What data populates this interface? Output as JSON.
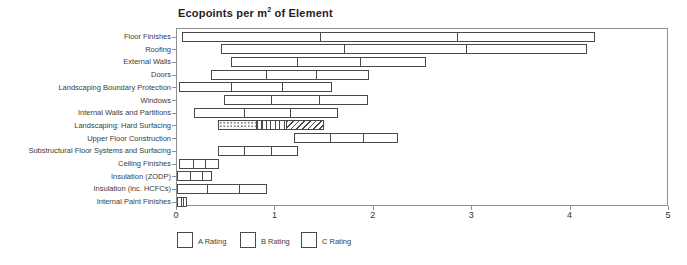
{
  "title": {
    "prefix": "Ecopoints per m",
    "sup": "2",
    "suffix": " of Element"
  },
  "colors": {
    "background": "#ffffff",
    "bar_border": "#4a4a4a",
    "frame": "#8f8f8f",
    "text": "#3c3c3c"
  },
  "chart_data": {
    "type": "bar",
    "orientation": "horizontal",
    "title": "Ecopoints per m2 of Element",
    "xlabel": "",
    "ylabel": "",
    "xlim": [
      0,
      5
    ],
    "x_tick_labels": [
      "0",
      "1",
      "2",
      "3",
      "4",
      "5"
    ],
    "grid": false,
    "legend_position": "bottom",
    "legend": [
      {
        "label": "A Rating",
        "pattern": "dots"
      },
      {
        "label": "B Rating",
        "pattern": "vertical-stripes"
      },
      {
        "label": "C Rating",
        "pattern": "diagonal-stripes"
      }
    ],
    "rows": [
      {
        "category": "Floor Finishes",
        "min": 0.05,
        "dividers": [
          1.46,
          2.86
        ],
        "max": 4.27
      },
      {
        "category": "Roofing",
        "min": 0.45,
        "dividers": [
          1.7,
          2.95
        ],
        "max": 4.18
      },
      {
        "category": "External Walls",
        "min": 0.55,
        "dividers": [
          1.22,
          1.87
        ],
        "max": 2.54
      },
      {
        "category": "Doors",
        "min": 0.35,
        "dividers": [
          0.91,
          1.42
        ],
        "max": 1.96
      },
      {
        "category": "Landscaping Boundary Protection",
        "min": 0.02,
        "dividers": [
          0.55,
          1.08
        ],
        "max": 1.58
      },
      {
        "category": "Windows",
        "min": 0.48,
        "dividers": [
          0.96,
          1.45
        ],
        "max": 1.95
      },
      {
        "category": "Internal Walls and Partitions",
        "min": 0.17,
        "dividers": [
          0.68,
          1.16
        ],
        "max": 1.64
      },
      {
        "category": "Landscaping: Hard Surfacing",
        "min": 0.42,
        "max": 1.5,
        "segments": [
          {
            "rating": "A",
            "from": 0.42,
            "to": 0.8,
            "pattern": "dots"
          },
          {
            "rating": "B",
            "from": 0.8,
            "to": 1.12,
            "pattern": "vertical-stripes"
          },
          {
            "rating": "C",
            "from": 1.12,
            "to": 1.5,
            "pattern": "diagonal-stripes"
          }
        ]
      },
      {
        "category": "Upper Floor Construction",
        "min": 1.19,
        "dividers": [
          1.56,
          1.9
        ],
        "max": 2.26
      },
      {
        "category": "Substructural Floor Systems and Surfacing",
        "min": 0.42,
        "dividers": [
          0.68,
          0.96
        ],
        "max": 1.23
      },
      {
        "category": "Ceiling Finishes",
        "min": 0.02,
        "dividers": [
          0.16,
          0.29
        ],
        "max": 0.43
      },
      {
        "category": "Insulation (ZODP)",
        "min": 0.0,
        "dividers": [
          0.13,
          0.26
        ],
        "max": 0.36
      },
      {
        "category": "Insulation (inc. HCFCs)",
        "min": 0.0,
        "dividers": [
          0.3,
          0.64
        ],
        "max": 0.92
      },
      {
        "category": "Internal Paint Finishes",
        "min": 0.0,
        "dividers": [
          0.04,
          0.07
        ],
        "max": 0.1
      }
    ]
  }
}
